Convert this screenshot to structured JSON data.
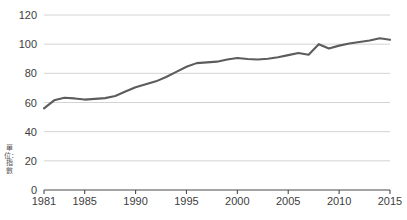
{
  "chart_data": {
    "type": "line",
    "title": "",
    "subtitle": "",
    "xlabel": "",
    "ylabel": "單位：指數",
    "ylim": [
      0,
      120
    ],
    "xlim": [
      1981,
      2015
    ],
    "yticks": [
      0,
      20,
      40,
      60,
      80,
      100,
      120
    ],
    "xticks": [
      1981,
      1985,
      1990,
      1995,
      2000,
      2005,
      2010,
      2015
    ],
    "grid": true,
    "legend": "none",
    "line_color": "#5c5c5c",
    "grid_color": "#c8c8c8",
    "axis_color": "#4a4a4a",
    "series": [
      {
        "name": "指數",
        "x": [
          1981,
          1982,
          1983,
          1984,
          1985,
          1986,
          1987,
          1988,
          1989,
          1990,
          1991,
          1992,
          1993,
          1994,
          1995,
          1996,
          1997,
          1998,
          1999,
          2000,
          2001,
          2002,
          2003,
          2004,
          2005,
          2006,
          2007,
          2008,
          2009,
          2010,
          2011,
          2012,
          2013,
          2014,
          2015
        ],
        "values": [
          56.0,
          61.5,
          63.3,
          62.8,
          62.0,
          62.5,
          63.0,
          64.5,
          67.5,
          70.5,
          72.5,
          74.5,
          77.5,
          81.0,
          84.5,
          87.0,
          87.5,
          88.0,
          89.5,
          90.5,
          89.8,
          89.5,
          90.0,
          91.0,
          92.5,
          94.0,
          92.8,
          100.0,
          97.0,
          99.0,
          100.5,
          101.5,
          102.5,
          104.0,
          103.0
        ]
      }
    ],
    "annotations": []
  },
  "axis": {
    "y_tick_labels": [
      "120",
      "100",
      "80",
      "60",
      "40",
      "20",
      "0"
    ],
    "x_tick_labels": [
      "1981",
      "1985",
      "1990",
      "1995",
      "2000",
      "2005",
      "2010",
      "2015"
    ],
    "y_axis_caption": "單位：指數"
  },
  "footnote": {
    "text": ""
  }
}
